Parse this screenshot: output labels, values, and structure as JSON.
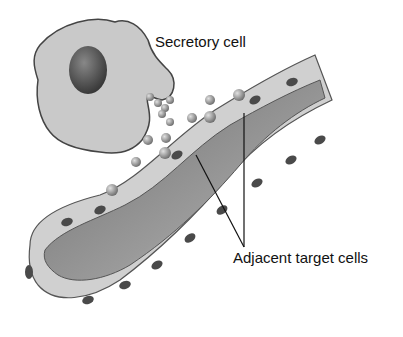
{
  "diagram": {
    "type": "biology-illustration",
    "labels": {
      "secretory_cell": "Secretory cell",
      "target_cells": "Adjacent target cells"
    },
    "colors": {
      "background": "#ffffff",
      "cell_fill": "#c8c8c8",
      "cell_outline": "#444444",
      "nucleus": "#555555",
      "lumen": "#8a8a8a",
      "molecule": "#9a9a9a",
      "leader_line": "#111111"
    }
  }
}
